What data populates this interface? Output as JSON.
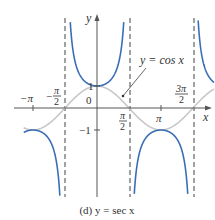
{
  "chart_data": {
    "type": "line",
    "title": "(d) y = sec x",
    "caption": "(d) y = sec x",
    "xlabel": "x",
    "ylabel": "y",
    "x_tick_labels": [
      "−π",
      "−π/2",
      "π/2",
      "π",
      "3π/2"
    ],
    "x_ticks": [
      -3.14159,
      -1.5708,
      1.5708,
      3.14159,
      4.71239
    ],
    "y_tick_labels": [
      "1",
      "−1"
    ],
    "y_ticks": [
      1,
      -1
    ],
    "origin_label": "0",
    "xlim": [
      -3.6,
      5.9
    ],
    "ylim": [
      -4,
      4
    ],
    "grid": false,
    "series": [
      {
        "name": "y = sec x",
        "color": "#3a6fb7",
        "style": "solid"
      },
      {
        "name": "y = cos x",
        "color": "#c8c8c8",
        "style": "solid"
      }
    ],
    "asymptotes": [
      {
        "x": -1.5708,
        "label": "x = −π/2",
        "style": "dashed"
      },
      {
        "x": 1.5708,
        "label": "x = π/2",
        "style": "dashed"
      },
      {
        "x": 4.71239,
        "label": "x = 3π/2",
        "style": "dashed"
      }
    ],
    "annotations": [
      {
        "text": "y = cos x",
        "points_to": [
          1.3,
          0.27
        ]
      }
    ],
    "sample_points": {
      "sec_x": [
        [
          -3.14159,
          -1
        ],
        [
          0,
          1
        ],
        [
          3.14159,
          -1
        ],
        [
          1.0472,
          2
        ],
        [
          -1.0472,
          2
        ],
        [
          2.0944,
          -2
        ],
        [
          4.18879,
          -2
        ],
        [
          -2.0944,
          -2
        ]
      ],
      "cos_x": [
        [
          -3.14159,
          -1
        ],
        [
          -1.5708,
          0
        ],
        [
          0,
          1
        ],
        [
          1.5708,
          0
        ],
        [
          3.14159,
          -1
        ],
        [
          4.71239,
          0
        ]
      ]
    }
  },
  "labels": {
    "y_axis": "y",
    "x_axis": "x",
    "origin": "0",
    "y_one": "1",
    "y_neg_one": "−1",
    "neg_pi": "−π",
    "neg_pi_half_num": "π",
    "neg_pi_half_sign": "−",
    "pi_half_num": "π",
    "pi": "π",
    "three_pi_half_num": "3π",
    "half_den": "2",
    "cos_label": "y = cos x",
    "caption": "(d) y = sec x"
  },
  "colors": {
    "sec": "#3a6fb7",
    "cos": "#c8c8c8",
    "axis": "#555555",
    "asymptote": "#555555"
  }
}
